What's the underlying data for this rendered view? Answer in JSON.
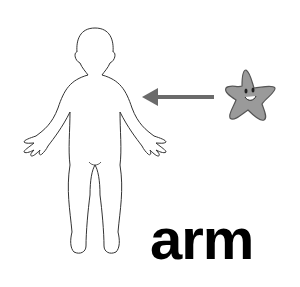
{
  "card": {
    "word": "arm",
    "colors": {
      "arrow": "#6b6b6b",
      "star_fill": "#9a9a9a",
      "outline": "#333333",
      "text": "#000000"
    }
  }
}
